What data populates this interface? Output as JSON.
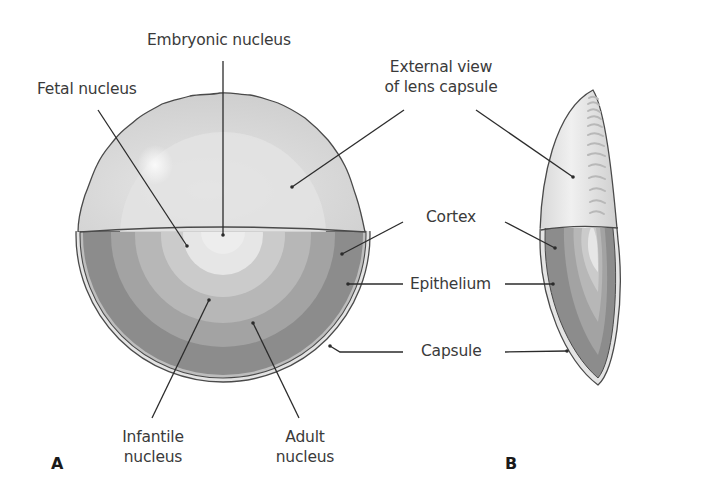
{
  "figure": {
    "panels": [
      {
        "id": "A",
        "label": "A"
      },
      {
        "id": "B",
        "label": "B"
      }
    ],
    "labels": {
      "embryonic_nucleus": "Embryonic nucleus",
      "fetal_nucleus": "Fetal nucleus",
      "external_view_line1": "External view",
      "external_view_line2": "of lens capsule",
      "cortex": "Cortex",
      "epithelium": "Epithelium",
      "capsule": "Capsule",
      "infantile_line1": "Infantile",
      "infantile_line2": "nucleus",
      "adult_line1": "Adult",
      "adult_line2": "nucleus"
    },
    "colors": {
      "outline": "#4a4a4a",
      "leader_line": "#2b2b2b",
      "text": "#3a3a3a",
      "capsule_outer_light": "#e4e4e4",
      "cortex_dark": "#8c8c8c",
      "ring_2": "#a3a3a3",
      "ring_3": "#b7b7b7",
      "ring_4": "#cbcbcb",
      "nucleus_center": "#e6e6e6",
      "upper_surface": "#d2d2d2",
      "upper_inner": "#e2e2e2"
    }
  }
}
